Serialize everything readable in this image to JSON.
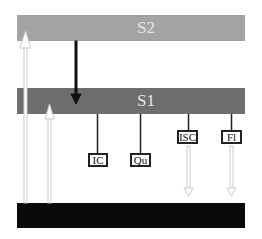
{
  "levels": {
    "s2": {
      "label": "S2",
      "color": "#a3a3a3"
    },
    "s1": {
      "label": "S1",
      "color": "#6e6e6e"
    },
    "s0": {
      "label": "",
      "color": "#0a0a0a"
    }
  },
  "processes": [
    {
      "label": "IC"
    },
    {
      "label": "Qu"
    },
    {
      "label": "ISC"
    },
    {
      "label": "Fl"
    }
  ]
}
